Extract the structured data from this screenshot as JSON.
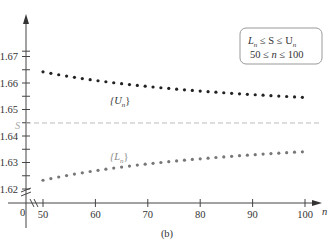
{
  "chart_data": {
    "type": "scatter",
    "title": "",
    "caption": "(b)",
    "xlabel": "n",
    "ylabel": "",
    "xlim": [
      50,
      100
    ],
    "ylim": [
      1.62,
      1.675
    ],
    "axis_break_y": true,
    "axis_break_x": true,
    "origin_label": "0",
    "x_ticks": [
      50,
      60,
      70,
      80,
      90,
      100
    ],
    "x_tick_labels": [
      "50",
      "60",
      "70",
      "80",
      "90",
      "100"
    ],
    "y_ticks": [
      1.62,
      1.63,
      1.64,
      1.65,
      1.66,
      1.67
    ],
    "y_tick_labels": [
      "1.62",
      "1.63",
      "1.64",
      "1.65",
      "1.66",
      "1.67"
    ],
    "y_minor_ticks": [
      1.625,
      1.635,
      1.645,
      1.655,
      1.665,
      1.672
    ],
    "reference_line": {
      "label": "S",
      "value": 1.6449,
      "style": "dashed",
      "color": "#bbbbbb"
    },
    "annotation_box": {
      "line1": "L_n ≤ S ≤ U_n",
      "line2": "50 ≤ n ≤ 100"
    },
    "series": [
      {
        "name": "{U_n}",
        "label": "{U_n}",
        "color": "#222222",
        "n_start": 50,
        "n_end": 100,
        "step": 2,
        "formula_fit": "1.6449 + 0.965/n",
        "values_sample": {
          "50": 1.6637,
          "60": 1.661,
          "70": 1.6587,
          "80": 1.657,
          "90": 1.6556,
          "100": 1.6536
        }
      },
      {
        "name": "{L_n}",
        "label": "{L_n}",
        "color": "#777777",
        "n_start": 50,
        "n_end": 100,
        "step": 2,
        "formula_fit": "1.6449 - 1.08/n",
        "values_sample": {
          "50": 1.624,
          "60": 1.627,
          "70": 1.6295,
          "80": 1.6313,
          "90": 1.6327,
          "100": 1.6337
        }
      }
    ],
    "grid": false,
    "legend": "inline labels"
  },
  "labels": {
    "u_label_main": "{U",
    "u_label_sub": "n",
    "u_label_end": "}",
    "l_label_main": "{L",
    "l_label_sub": "n",
    "l_label_end": "}",
    "s_label": "S",
    "x_axis_label": "n",
    "origin": "0",
    "caption": "(b)",
    "box_L": "L",
    "box_n1": "n",
    "box_mid1": " ≤ S ≤ U",
    "box_n2": "n",
    "box_line2a": "50 ≤ ",
    "box_line2b": "n",
    "box_line2c": " ≤ 100"
  }
}
